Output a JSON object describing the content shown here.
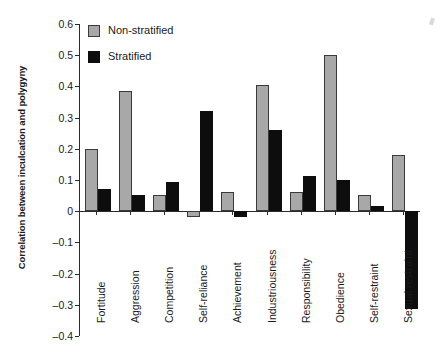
{
  "chart_data": {
    "type": "bar",
    "title": "",
    "xlabel": "",
    "ylabel": "Correlation between inculcation and polygyny",
    "ylim": [
      -0.4,
      0.6
    ],
    "ytick_values": [
      0.6,
      0.5,
      0.4,
      0.3,
      0.2,
      0.1,
      0,
      -0.1,
      -0.2,
      -0.3,
      -0.4
    ],
    "ytick_labels": [
      "0.6",
      "0.5",
      "0.4",
      "0.3",
      "0.2",
      "0.1",
      "0",
      "–0.1",
      "–0.2",
      "–0.3",
      "–0.4"
    ],
    "grid": false,
    "legend_position": "top-left",
    "categories": [
      "Fortitude",
      "Aggression",
      "Competition",
      "Self-reliance",
      "Achievement",
      "Industriousness",
      "Responsibility",
      "Obedience",
      "Self-restraint",
      "Sexual restraint"
    ],
    "series": [
      {
        "name": "Non-stratified",
        "color": "#a8a8a8",
        "values": [
          0.2,
          0.385,
          0.053,
          -0.02,
          0.06,
          0.405,
          0.06,
          0.5,
          0.053,
          0.18
        ]
      },
      {
        "name": "Stratified",
        "color": "#0d0d0d",
        "values": [
          0.07,
          0.053,
          0.093,
          0.32,
          -0.02,
          0.26,
          0.113,
          0.1,
          0.018,
          -0.312
        ]
      }
    ]
  },
  "legend": {
    "entries": [
      {
        "label": "Non-stratified",
        "swatch": "gray"
      },
      {
        "label": "Stratified",
        "swatch": "black"
      }
    ]
  }
}
